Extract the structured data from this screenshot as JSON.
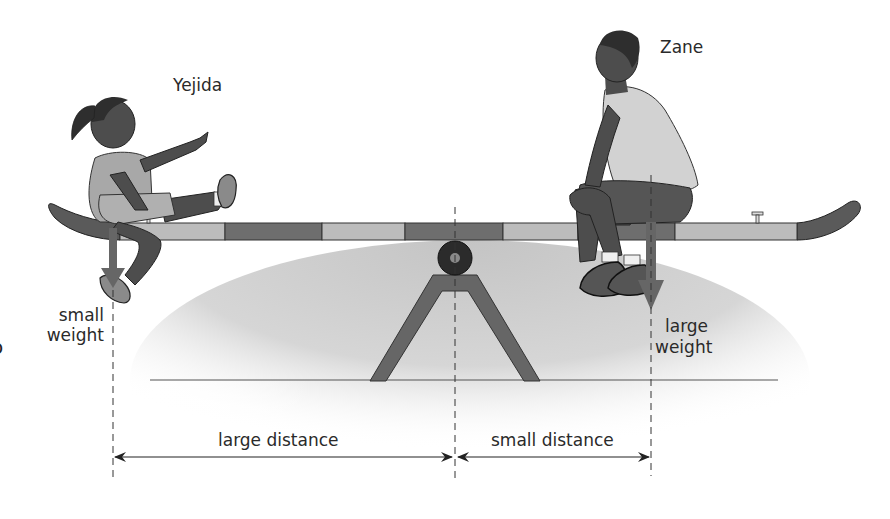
{
  "diagram": {
    "people": [
      {
        "name": "Yejida",
        "weight_label": "small weight",
        "side": "left",
        "position_x": 113
      },
      {
        "name": "Zane",
        "weight_label": "large weight",
        "side": "right",
        "position_x": 651
      }
    ],
    "labels": {
      "yejida": "Yejida",
      "zane": "Zane",
      "small_weight_line1": "small",
      "small_weight_line2": "weight",
      "large_weight_line1": "large",
      "large_weight_line2": "weight",
      "large_distance": "large distance",
      "small_distance": "small distance",
      "partial_left_glyph": "o"
    },
    "fulcrum_x": 455,
    "colors": {
      "board_light": "#b9b9b9",
      "board_dark": "#6e6e6e",
      "board_end": "#5a5a5a",
      "stand": "#666666",
      "arrow": "#666666",
      "skin": "#4d4d4d",
      "hair": "#2e2e2e",
      "shirt_light": "#d2d2d2",
      "shorts_dark": "#555555",
      "ground_line": "#555555",
      "shadow": "#c8c8c8",
      "text": "#2a2a2a"
    }
  }
}
